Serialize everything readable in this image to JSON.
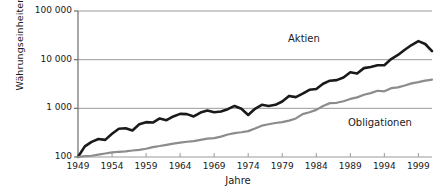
{
  "chart_data": {
    "type": "line",
    "title": "",
    "xlabel": "Jahre",
    "ylabel": "Währungseinheiten",
    "yscale": "log",
    "ylim": [
      100,
      100000
    ],
    "xlim": [
      1949,
      2001
    ],
    "grid": true,
    "legend_position": "inline-annotations",
    "y_ticks": [
      "100",
      "1 000",
      "10 000",
      "100 000"
    ],
    "y_tick_values": [
      100,
      1000,
      10000,
      100000
    ],
    "x_ticks": [
      "1949",
      "1954",
      "1959",
      "1964",
      "1969",
      "1974",
      "1979",
      "1984",
      "1989",
      "1994",
      "1999"
    ],
    "x_tick_values": [
      1949,
      1954,
      1959,
      1964,
      1969,
      1974,
      1979,
      1984,
      1989,
      1994,
      1999
    ],
    "annotations": [
      {
        "text": "Aktien",
        "x": 1983,
        "y": 20000
      },
      {
        "text": "Obligationen",
        "x": 1993,
        "y": 700
      }
    ],
    "series": [
      {
        "name": "Aktien",
        "color": "#1a1a1a",
        "width": 2.6,
        "x": [
          1949,
          1950,
          1951,
          1952,
          1953,
          1954,
          1955,
          1956,
          1957,
          1958,
          1959,
          1960,
          1961,
          1962,
          1963,
          1964,
          1965,
          1966,
          1967,
          1968,
          1969,
          1970,
          1971,
          1972,
          1973,
          1974,
          1975,
          1976,
          1977,
          1978,
          1979,
          1980,
          1981,
          1982,
          1983,
          1984,
          1985,
          1986,
          1987,
          1988,
          1989,
          1990,
          1991,
          1992,
          1993,
          1994,
          1995,
          1996,
          1997,
          1998,
          1999,
          2000,
          2001
        ],
        "values": [
          100,
          165,
          205,
          235,
          225,
          300,
          380,
          390,
          350,
          470,
          520,
          510,
          620,
          570,
          680,
          770,
          760,
          680,
          820,
          900,
          830,
          860,
          960,
          1120,
          980,
          730,
          980,
          1180,
          1120,
          1180,
          1380,
          1800,
          1700,
          2000,
          2400,
          2500,
          3200,
          3700,
          3800,
          4300,
          5500,
          5200,
          6700,
          7100,
          7700,
          7700,
          10300,
          12500,
          16000,
          20000,
          24000,
          21000,
          15000
        ]
      },
      {
        "name": "Obligationen",
        "color": "#8c8c8c",
        "width": 2.2,
        "x": [
          1949,
          1950,
          1951,
          1952,
          1953,
          1954,
          1955,
          1956,
          1957,
          1958,
          1959,
          1960,
          1961,
          1962,
          1963,
          1964,
          1965,
          1966,
          1967,
          1968,
          1969,
          1970,
          1971,
          1972,
          1973,
          1974,
          1975,
          1976,
          1977,
          1978,
          1979,
          1980,
          1981,
          1982,
          1983,
          1984,
          1985,
          1986,
          1987,
          1988,
          1989,
          1990,
          1991,
          1992,
          1993,
          1994,
          1995,
          1996,
          1997,
          1998,
          1999,
          2000,
          2001
        ],
        "values": [
          100,
          104,
          106,
          112,
          118,
          124,
          128,
          130,
          136,
          140,
          148,
          160,
          168,
          178,
          188,
          198,
          206,
          212,
          225,
          238,
          245,
          262,
          290,
          310,
          322,
          340,
          385,
          440,
          470,
          500,
          520,
          560,
          620,
          760,
          830,
          930,
          1120,
          1280,
          1300,
          1400,
          1560,
          1680,
          1900,
          2050,
          2300,
          2240,
          2600,
          2700,
          2950,
          3250,
          3450,
          3700,
          3900
        ]
      }
    ]
  },
  "axis": {
    "y_title": "Währungseinheiten",
    "x_title": "Jahre"
  },
  "labels": {
    "aktien": "Aktien",
    "obligationen": "Obligationen"
  }
}
